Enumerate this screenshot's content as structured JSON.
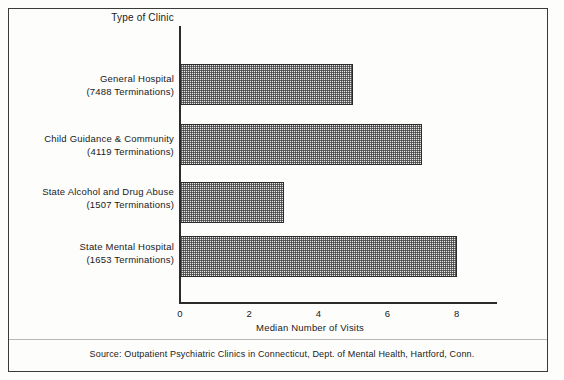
{
  "chart_data": {
    "type": "bar",
    "orientation": "horizontal",
    "title": "",
    "xlabel": "Median Number of Visits",
    "ylabel": "Type of Clinic",
    "xlim": [
      0,
      9.4
    ],
    "grid": false,
    "legend": null,
    "xticks": [
      0,
      2,
      4,
      6,
      8
    ],
    "xtick_labels": [
      "0",
      "2",
      "4",
      "6",
      "8"
    ],
    "categories": [
      "General Hospital",
      "Child Guidance & Community",
      "State Alcohol and Drug Abuse",
      "State Mental Hospital"
    ],
    "category_sublabels": [
      "(7488 Terminations)",
      "(4119 Terminations)",
      "(1507 Terminations)",
      "(1653 Terminations)"
    ],
    "values": [
      5,
      7,
      3,
      8
    ],
    "bar_fill": "#e8e8e8",
    "bar_edge": "#2b2b2b",
    "source": "Source: Outpatient Psychiatric Clinics in Connecticut, Dept. of Mental Health, Hartford, Conn."
  }
}
